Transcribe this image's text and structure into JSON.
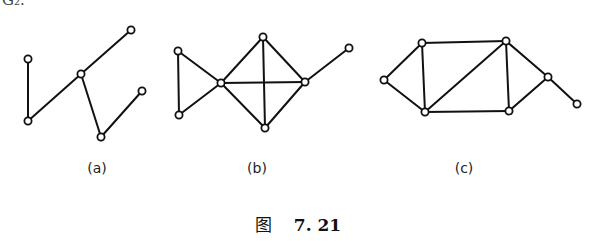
{
  "cutoff_text": "G₂.",
  "graphs": [
    {
      "id": "a",
      "label": "(a)",
      "label_pos": [
        97,
        160
      ],
      "nodes": [
        [
          28,
          59
        ],
        [
          131,
          30
        ],
        [
          81,
          74
        ],
        [
          28,
          121
        ],
        [
          101,
          137
        ],
        [
          142,
          91
        ]
      ],
      "edges": [
        [
          0,
          3
        ],
        [
          3,
          2
        ],
        [
          2,
          1
        ],
        [
          2,
          4
        ],
        [
          4,
          5
        ]
      ]
    },
    {
      "id": "b",
      "label": "(b)",
      "label_pos": [
        257,
        160
      ],
      "nodes": [
        [
          178,
          51
        ],
        [
          221,
          83
        ],
        [
          263,
          37
        ],
        [
          305,
          82
        ],
        [
          349,
          48
        ],
        [
          179,
          115
        ],
        [
          265,
          128
        ]
      ],
      "edges": [
        [
          0,
          5
        ],
        [
          0,
          1
        ],
        [
          5,
          1
        ],
        [
          1,
          2
        ],
        [
          1,
          3
        ],
        [
          1,
          6
        ],
        [
          2,
          3
        ],
        [
          2,
          6
        ],
        [
          3,
          6
        ],
        [
          3,
          4
        ]
      ]
    },
    {
      "id": "c",
      "label": "(c)",
      "label_pos": [
        464,
        160
      ],
      "nodes": [
        [
          384,
          80
        ],
        [
          422,
          43
        ],
        [
          506,
          41
        ],
        [
          548,
          77
        ],
        [
          577,
          104
        ],
        [
          425,
          112
        ],
        [
          509,
          111
        ]
      ],
      "edges": [
        [
          0,
          1
        ],
        [
          0,
          5
        ],
        [
          1,
          2
        ],
        [
          1,
          5
        ],
        [
          5,
          2
        ],
        [
          5,
          6
        ],
        [
          2,
          6
        ],
        [
          2,
          3
        ],
        [
          6,
          3
        ],
        [
          3,
          4
        ]
      ]
    }
  ],
  "caption": {
    "fig_word": "图",
    "number": "7. 21"
  }
}
